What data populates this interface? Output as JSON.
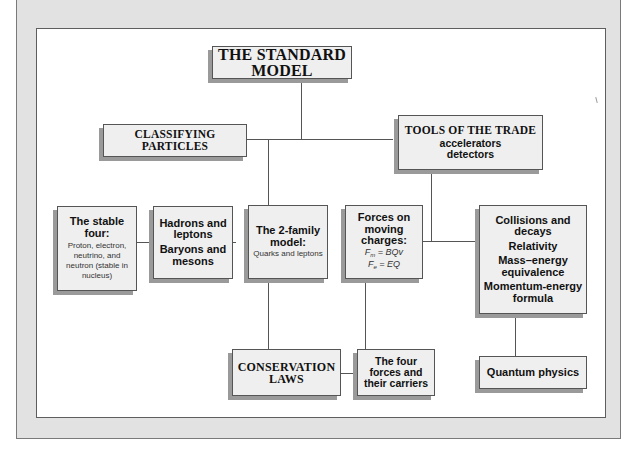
{
  "diagram": {
    "title": "THE STANDARD MODEL",
    "nodes": {
      "classifying": {
        "line1": "CLASSIFYING",
        "line2": "PARTICLES"
      },
      "tools": {
        "title": "TOOLS OF THE TRADE",
        "item1": "accelerators",
        "item2": "detectors"
      },
      "stable_four": {
        "title_line1": "The stable",
        "title_line2": "four:",
        "body": "Proton, electron, neutrino, and neutron (stable in nucleus)"
      },
      "hadrons": {
        "line1": "Hadrons and",
        "line2": "leptons",
        "line3": "Baryons and",
        "line4": "mesons"
      },
      "two_family": {
        "title_line1": "The 2-family",
        "title_line2": "model:",
        "body": "Quarks and leptons"
      },
      "forces_moving": {
        "title_line1": "Forces on",
        "title_line2": "moving",
        "title_line3": "charges:",
        "formula1_lhs": "F",
        "formula1_sub": "m",
        "formula1_rhs": " = BQv",
        "formula2_lhs": "F",
        "formula2_sub": "e",
        "formula2_rhs": " = EQ"
      },
      "collisions": {
        "item1_line1": "Collisions and",
        "item1_line2": "decays",
        "item2": "Relativity",
        "item3_line1": "Mass–energy",
        "item3_line2": "equivalence",
        "item4_line1": "Momentum-energy",
        "item4_line2": "formula"
      },
      "conservation": {
        "line1": "CONSERVATION",
        "line2": "LAWS"
      },
      "four_forces": {
        "line1": "The four",
        "line2": "forces and",
        "line3": "their carriers"
      },
      "quantum": {
        "label": "Quantum physics"
      }
    },
    "colors": {
      "frame": "#e2e2e2",
      "panel": "#ffffff",
      "box_fill": "#efefef",
      "box_border": "#555555",
      "shadow": "#9a9a9a",
      "connector": "#555555"
    }
  }
}
